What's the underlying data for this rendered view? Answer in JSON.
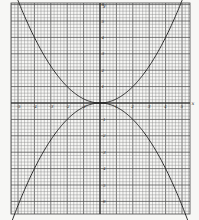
{
  "chart_data": {
    "type": "line",
    "title": "",
    "xlabel": "x",
    "ylabel": "y",
    "grid": true,
    "xlim": [
      -5.4,
      5.4
    ],
    "ylim": [
      -6.6,
      6.2
    ],
    "x_ticks": [
      -5,
      -4,
      -3,
      -2,
      -1,
      1,
      2,
      3,
      4,
      5
    ],
    "y_ticks": [
      -6,
      -5,
      -4,
      -3,
      -2,
      -1,
      1,
      2,
      3,
      4,
      5,
      6
    ],
    "x_tick_labels": [
      "-5",
      "-4",
      "-3",
      "-2",
      "-1",
      "1",
      "2",
      "3",
      "4",
      "5"
    ],
    "y_tick_labels": [
      "-6",
      "-5",
      "-4",
      "-3",
      "-2",
      "-1",
      "1",
      "2",
      "3",
      "4",
      "5",
      "6"
    ],
    "series": [
      {
        "name": "upper parabola",
        "x": [
          -5,
          -4,
          -3,
          -2,
          -1,
          0,
          1,
          2,
          3,
          4,
          5
        ],
        "y": [
          6.25,
          4,
          2.25,
          1,
          0.25,
          0,
          0.25,
          1,
          2.25,
          4,
          6.25
        ]
      },
      {
        "name": "lower parabola",
        "x": [
          -5,
          -4,
          -3,
          -2,
          -1,
          0,
          1,
          2,
          3,
          4,
          5
        ],
        "y": [
          -6.25,
          -4,
          -2.25,
          -1,
          -0.25,
          0,
          -0.25,
          -1,
          -2.25,
          -4,
          -6.25
        ]
      }
    ]
  }
}
